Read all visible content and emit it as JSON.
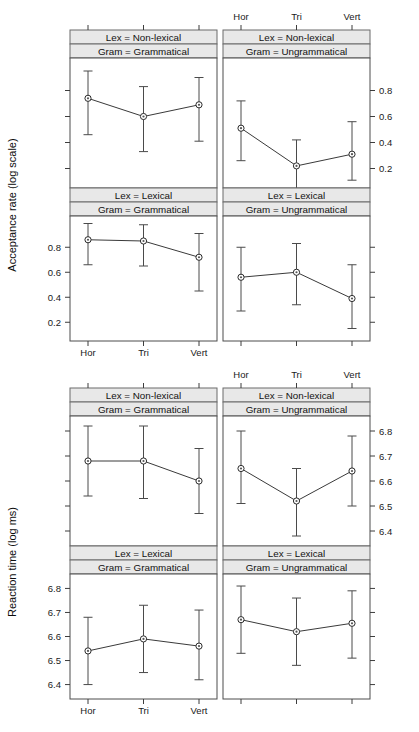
{
  "figure": {
    "width": 419,
    "height": 732,
    "background": "#ffffff",
    "strip_fill": "#e8e8e8",
    "line_color": "#3a3a3a",
    "point_fill": "#ffffff",
    "point_edge": "#2b2b2b"
  },
  "charts": [
    {
      "id": "acceptance",
      "ylabel": "Acceptance rate (log scale)",
      "ytick_labels": [
        "0.2",
        "0.4",
        "0.6",
        "0.8"
      ],
      "xtick_labels": [
        "Hor",
        "Tri",
        "Vert"
      ],
      "strips_row1": [
        "Lex = Non-lexical",
        "Lex = Non-lexical"
      ],
      "strips_row1b": [
        "Gram = Grammatical",
        "Gram = Ungrammatical"
      ],
      "strips_row2": [
        "Lex = Lexical",
        "Lex = Lexical"
      ],
      "strips_row2b": [
        "Gram = Grammatical",
        "Gram = Ungrammatical"
      ]
    },
    {
      "id": "reaction",
      "ylabel": "Reaction time (log ms)",
      "ytick_labels": [
        "6.4",
        "6.5",
        "6.6",
        "6.7",
        "6.8"
      ],
      "xtick_labels": [
        "Hor",
        "Tri",
        "Vert"
      ],
      "strips_row1": [
        "Lex = Non-lexical",
        "Lex = Non-lexical"
      ],
      "strips_row1b": [
        "Gram = Grammatical",
        "Gram = Ungrammatical"
      ],
      "strips_row2": [
        "Lex = Lexical",
        "Lex = Lexical"
      ],
      "strips_row2b": [
        "Gram = Grammatical",
        "Gram = Ungrammatical"
      ]
    }
  ],
  "chart_data": [
    {
      "type": "line",
      "id": "acceptance-rate",
      "title": "",
      "ylabel": "Acceptance rate (log scale)",
      "xlabel": "",
      "x": [
        "Hor",
        "Tri",
        "Vert"
      ],
      "ylim": [
        0.05,
        1.05
      ],
      "yticks": [
        0.2,
        0.4,
        0.6,
        0.8
      ],
      "grid": false,
      "legend": "none",
      "error_bars": "95% CI",
      "panels": [
        {
          "row": 0,
          "col": 0,
          "strip_top": "Lex = Non-lexical",
          "strip_bottom": "Gram = Grammatical",
          "values": [
            0.74,
            0.6,
            0.69
          ],
          "lower": [
            0.46,
            0.33,
            0.41
          ],
          "upper": [
            0.95,
            0.83,
            0.9
          ]
        },
        {
          "row": 0,
          "col": 1,
          "strip_top": "Lex = Non-lexical",
          "strip_bottom": "Gram = Ungrammatical",
          "values": [
            0.51,
            0.22,
            0.31
          ],
          "lower": [
            0.26,
            0.04,
            0.11
          ],
          "upper": [
            0.72,
            0.42,
            0.56
          ]
        },
        {
          "row": 1,
          "col": 0,
          "strip_top": "Lex = Lexical",
          "strip_bottom": "Gram = Grammatical",
          "values": [
            0.86,
            0.85,
            0.72
          ],
          "lower": [
            0.66,
            0.65,
            0.45
          ],
          "upper": [
            0.99,
            0.98,
            0.91
          ]
        },
        {
          "row": 1,
          "col": 1,
          "strip_top": "Lex = Lexical",
          "strip_bottom": "Gram = Ungrammatical",
          "values": [
            0.56,
            0.6,
            0.39
          ],
          "lower": [
            0.29,
            0.34,
            0.15
          ],
          "upper": [
            0.8,
            0.83,
            0.66
          ]
        }
      ]
    },
    {
      "type": "line",
      "id": "reaction-time",
      "title": "",
      "ylabel": "Reaction time (log ms)",
      "xlabel": "",
      "x": [
        "Hor",
        "Tri",
        "Vert"
      ],
      "ylim": [
        6.34,
        6.86
      ],
      "yticks": [
        6.4,
        6.5,
        6.6,
        6.7,
        6.8
      ],
      "grid": false,
      "legend": "none",
      "error_bars": "95% CI",
      "panels": [
        {
          "row": 0,
          "col": 0,
          "strip_top": "Lex = Non-lexical",
          "strip_bottom": "Gram = Grammatical",
          "values": [
            6.68,
            6.68,
            6.6
          ],
          "lower": [
            6.54,
            6.53,
            6.47
          ],
          "upper": [
            6.82,
            6.82,
            6.73
          ]
        },
        {
          "row": 0,
          "col": 1,
          "strip_top": "Lex = Non-lexical",
          "strip_bottom": "Gram = Ungrammatical",
          "values": [
            6.65,
            6.52,
            6.64
          ],
          "lower": [
            6.51,
            6.38,
            6.5
          ],
          "upper": [
            6.8,
            6.65,
            6.78
          ]
        },
        {
          "row": 1,
          "col": 0,
          "strip_top": "Lex = Lexical",
          "strip_bottom": "Gram = Grammatical",
          "values": [
            6.54,
            6.59,
            6.56
          ],
          "lower": [
            6.4,
            6.45,
            6.42
          ],
          "upper": [
            6.68,
            6.73,
            6.71
          ]
        },
        {
          "row": 1,
          "col": 1,
          "strip_top": "Lex = Lexical",
          "strip_bottom": "Gram = Ungrammatical",
          "values": [
            6.67,
            6.62,
            6.655
          ],
          "lower": [
            6.53,
            6.48,
            6.51
          ],
          "upper": [
            6.81,
            6.76,
            6.79
          ]
        }
      ]
    }
  ]
}
